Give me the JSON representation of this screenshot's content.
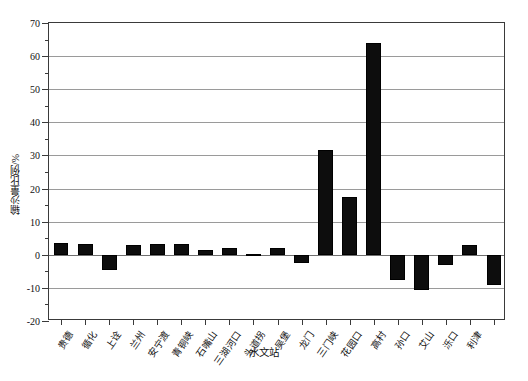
{
  "chart_data": {
    "type": "bar",
    "title": "",
    "xlabel": "水文站",
    "ylabel": "输沙量比例/%",
    "ylim": [
      -20,
      70
    ],
    "yticks": [
      -20,
      -10,
      0,
      10,
      20,
      30,
      40,
      50,
      60,
      70
    ],
    "ytick_labels": [
      "-20",
      "-10",
      "0",
      "10",
      "20",
      "30",
      "40",
      "50",
      "60",
      "70"
    ],
    "y_minor_step": 5,
    "grid": "horizontal",
    "legend": "none",
    "bar_color": "#0d0d0d",
    "categories": [
      "贵德",
      "循化",
      "上诠",
      "兰州",
      "安宁渡",
      "青铜峡",
      "石嘴山",
      "三湖河口",
      "头道拐",
      "吴堡",
      "龙门",
      "三门峡",
      "花园口",
      "高村",
      "孙口",
      "艾山",
      "泺口",
      "利津"
    ],
    "values": [
      3.5,
      3.2,
      -4.5,
      3.0,
      3.2,
      1.3,
      2.0,
      -2.5,
      31.5,
      17.5,
      64.0,
      -7.5,
      -10.5,
      -3.0,
      3.0,
      -9.0,
      3.5,
      0.0
    ],
    "series": [
      {
        "name": "输沙量比例",
        "points": [
          {
            "category": "贵德",
            "value": 3.5
          },
          {
            "category": "循化",
            "value": 3.2
          },
          {
            "category": "上诠",
            "value": -4.5
          },
          {
            "category": "兰州",
            "value": 3.0
          },
          {
            "category": "安宁渡",
            "value": 3.2
          },
          {
            "category": "青铜峡",
            "value": 1.3
          },
          {
            "category": "石嘴山",
            "value": 2.0
          },
          {
            "category": "三湖河口",
            "value": 0.3
          },
          {
            "category": "头道拐",
            "value": 2.0
          },
          {
            "category": "吴堡",
            "value": -2.5
          },
          {
            "category": "龙门",
            "value": 31.5
          },
          {
            "category": "三门峡",
            "value": 17.5
          },
          {
            "category": "花园口",
            "value": 64.0
          },
          {
            "category": "高村",
            "value": -7.5
          },
          {
            "category": "孙口",
            "value": -10.5
          },
          {
            "category": "艾山",
            "value": -3.0
          },
          {
            "category": "泺口",
            "value": 3.0
          },
          {
            "category": "利津",
            "value": -9.0
          }
        ]
      }
    ],
    "bars": [
      {
        "label": "贵德",
        "value": 3.5
      },
      {
        "label": "循化",
        "value": 3.2
      },
      {
        "label": "上诠",
        "value": -4.5
      },
      {
        "label": "兰州",
        "value": 3.0
      },
      {
        "label": "安宁渡",
        "value": 3.2
      },
      {
        "label": "青铜峡",
        "value": 3.2
      },
      {
        "label": "石嘴山",
        "value": 1.3
      },
      {
        "label": "三湖河口",
        "value": 2.0
      },
      {
        "label": "头道拐",
        "value": 0.3
      },
      {
        "label": "吴堡",
        "value": 2.0
      },
      {
        "label": "龙门",
        "value": -2.5
      },
      {
        "label": "三门峡",
        "value": 31.5
      },
      {
        "label": "花园口",
        "value": 17.5
      },
      {
        "label": "高村",
        "value": 64.0
      },
      {
        "label": "孙口",
        "value": -7.5
      },
      {
        "label": "艾山",
        "value": -10.5
      },
      {
        "label": "泺口",
        "value": -3.0
      },
      {
        "label": "利津",
        "value": 3.0
      },
      {
        "label": "利津2",
        "value": -9.0
      }
    ]
  }
}
